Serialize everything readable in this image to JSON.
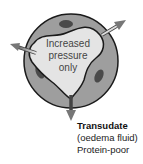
{
  "diagram": {
    "center_label": [
      "Increased",
      "pressure",
      "only"
    ],
    "output_label": {
      "title": "Transudate",
      "subtitle": "(oedema fluid)",
      "note": "Protein-poor"
    },
    "icons": [
      "vessel-cross-section",
      "arrow-left-up",
      "arrow-right-up",
      "arrow-down",
      "cell-nucleus"
    ],
    "colors": {
      "vessel_wall": "#9e9e9e",
      "lumen": "#e4e4e4",
      "nucleus": "#4a4a4a",
      "outline": "#1a1a1a",
      "arrow": "#7a7a7a"
    }
  }
}
